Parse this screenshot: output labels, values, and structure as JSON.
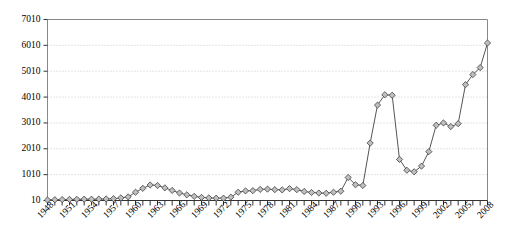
{
  "chart_data": {
    "type": "line",
    "title": "",
    "subtitle": "",
    "xlabel": "",
    "ylabel": "",
    "grid": true,
    "legend": false,
    "marker": "diamond",
    "xlim": [
      1948,
      2008
    ],
    "ylim": [
      10,
      7010
    ],
    "ytick_labels": [
      "10",
      "1010",
      "2010",
      "3010",
      "4010",
      "5010",
      "6010",
      "7010"
    ],
    "ytick_values": [
      10,
      1010,
      2010,
      3010,
      4010,
      5010,
      6010,
      7010
    ],
    "xtick_labels": [
      "1948",
      "1951",
      "1954",
      "1957",
      "1960",
      "1963",
      "1966",
      "1969",
      "1972",
      "1975",
      "1978",
      "1981",
      "1984",
      "1987",
      "1990",
      "1993",
      "1996",
      "1999",
      "2002",
      "2005",
      "2008"
    ],
    "xtick_values": [
      1948,
      1951,
      1954,
      1957,
      1960,
      1963,
      1966,
      1969,
      1972,
      1975,
      1978,
      1981,
      1984,
      1987,
      1990,
      1993,
      1996,
      1999,
      2002,
      2005,
      2008
    ],
    "x": [
      1948,
      1949,
      1950,
      1951,
      1952,
      1953,
      1954,
      1955,
      1956,
      1957,
      1958,
      1959,
      1960,
      1961,
      1962,
      1963,
      1964,
      1965,
      1966,
      1967,
      1968,
      1969,
      1970,
      1971,
      1972,
      1973,
      1974,
      1975,
      1976,
      1977,
      1978,
      1979,
      1980,
      1981,
      1982,
      1983,
      1984,
      1985,
      1986,
      1987,
      1988,
      1989,
      1990,
      1991,
      1992,
      1993,
      1994,
      1995,
      1996,
      1997,
      1998,
      1999,
      2000,
      2001,
      2002,
      2003,
      2004,
      2005,
      2006,
      2007,
      2008
    ],
    "values": [
      30,
      40,
      45,
      50,
      55,
      60,
      60,
      65,
      70,
      80,
      110,
      150,
      330,
      480,
      610,
      590,
      500,
      400,
      300,
      230,
      170,
      130,
      110,
      100,
      100,
      140,
      330,
      380,
      390,
      440,
      450,
      430,
      420,
      470,
      430,
      360,
      320,
      300,
      290,
      330,
      370,
      900,
      620,
      590,
      2230,
      3700,
      4100,
      4080,
      1600,
      1180,
      1120,
      1340,
      1900,
      2920,
      3010,
      2870,
      2980,
      4490,
      4880,
      5150,
      6100
    ],
    "colors": {
      "line": "#555555",
      "marker_fill": "#bfbfbf",
      "marker_edge": "#404040",
      "grid": "#c8c8c8",
      "axis": "#888888",
      "text": "#000000"
    }
  }
}
